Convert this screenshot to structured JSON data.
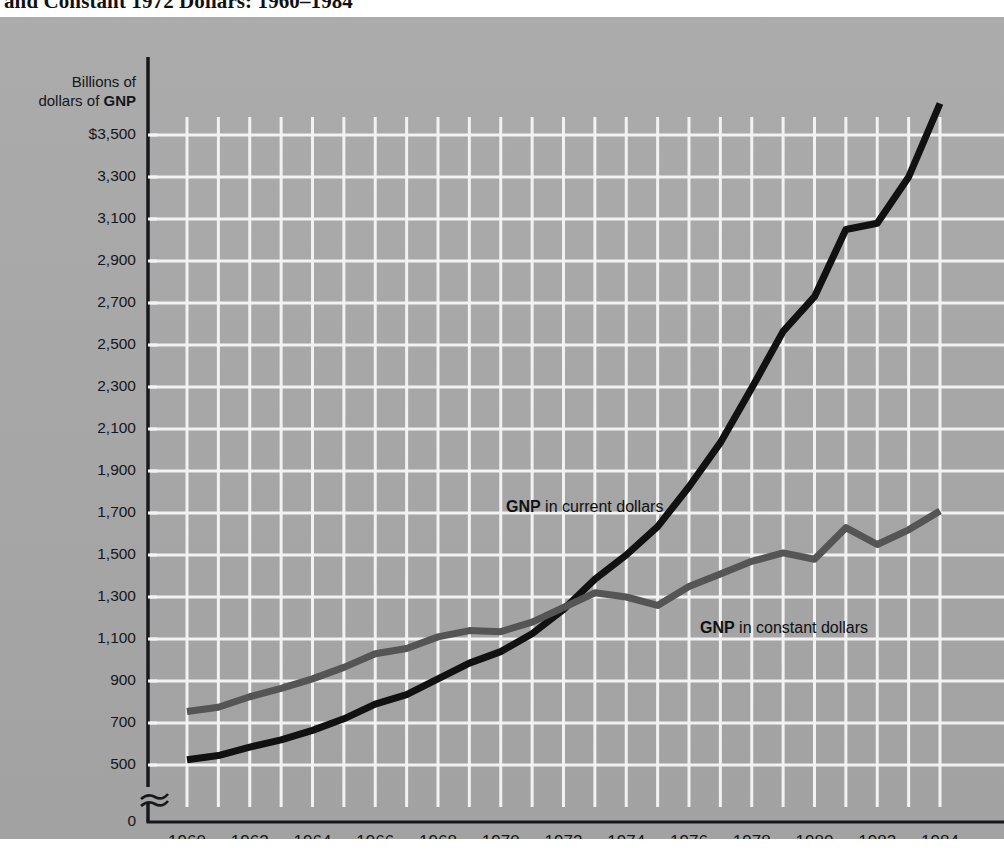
{
  "figure": {
    "title": "and Constant 1972 Dollars: 1960–1984",
    "y_axis_caption_line1": "Billions of",
    "y_axis_caption_line2_prefix": "dollars of ",
    "y_axis_caption_line2_bold": "GNP"
  },
  "annotations": {
    "current": {
      "bold": "GNP",
      "rest": " in current dollars"
    },
    "constant": {
      "bold": "GNP",
      "rest": " in constant dollars"
    }
  },
  "chart_data": {
    "type": "line",
    "title": "and Constant 1972 Dollars: 1960–1984",
    "xlabel": "",
    "ylabel": "Billions of dollars of GNP",
    "xlim": [
      1960,
      1984
    ],
    "ylim": [
      400,
      3700
    ],
    "y_axis_break": true,
    "grid": true,
    "legend": "inline-annotation",
    "ytick_labels": [
      "$3,500",
      "3,300",
      "3,100",
      "2,900",
      "2,700",
      "2,500",
      "2,300",
      "2,100",
      "1,900",
      "1,700",
      "1,500",
      "1,300",
      "1,100",
      "900",
      "700",
      "500",
      "0"
    ],
    "ytick_values": [
      3500,
      3300,
      3100,
      2900,
      2700,
      2500,
      2300,
      2100,
      1900,
      1700,
      1500,
      1300,
      1100,
      900,
      700,
      500,
      0
    ],
    "xtick_labels": [
      "1960",
      "1962",
      "1964",
      "1966",
      "1968",
      "1970",
      "1972",
      "1974",
      "1976",
      "1978",
      "1980",
      "1982",
      "1984"
    ],
    "xtick_values": [
      1960,
      1962,
      1964,
      1966,
      1968,
      1970,
      1972,
      1974,
      1976,
      1978,
      1980,
      1982,
      1984
    ],
    "x": [
      1960,
      1961,
      1962,
      1963,
      1964,
      1965,
      1966,
      1967,
      1968,
      1969,
      1970,
      1971,
      1972,
      1973,
      1974,
      1975,
      1976,
      1977,
      1978,
      1979,
      1980,
      1981,
      1982,
      1983,
      1984
    ],
    "series": [
      {
        "name": "GNP in current dollars",
        "color": "#111111",
        "linewidth": 7,
        "values": [
          525,
          545,
          585,
          620,
          665,
          720,
          790,
          835,
          910,
          985,
          1040,
          1125,
          1240,
          1385,
          1500,
          1635,
          1825,
          2035,
          2295,
          2565,
          2730,
          3050,
          3080,
          3300,
          3650
        ]
      },
      {
        "name": "GNP in constant dollars",
        "color": "#555555",
        "linewidth": 7,
        "values": [
          755,
          775,
          825,
          865,
          910,
          965,
          1030,
          1055,
          1110,
          1140,
          1135,
          1180,
          1250,
          1320,
          1300,
          1260,
          1350,
          1410,
          1470,
          1510,
          1480,
          1630,
          1550,
          1620,
          1710
        ]
      }
    ]
  }
}
